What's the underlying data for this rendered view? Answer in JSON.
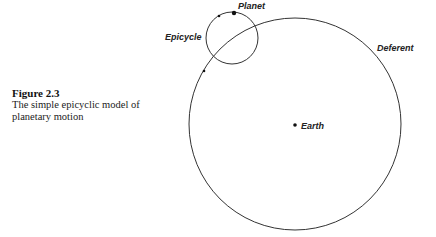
{
  "caption": {
    "figure_number": "Figure 2.3",
    "line1": "The simple epicyclic model of",
    "line2": "planetary motion"
  },
  "diagram": {
    "labels": {
      "planet": "Planet",
      "epicycle": "Epicycle",
      "deferent": "Deferent",
      "earth": "Earth"
    },
    "stroke_color": "#333333"
  }
}
